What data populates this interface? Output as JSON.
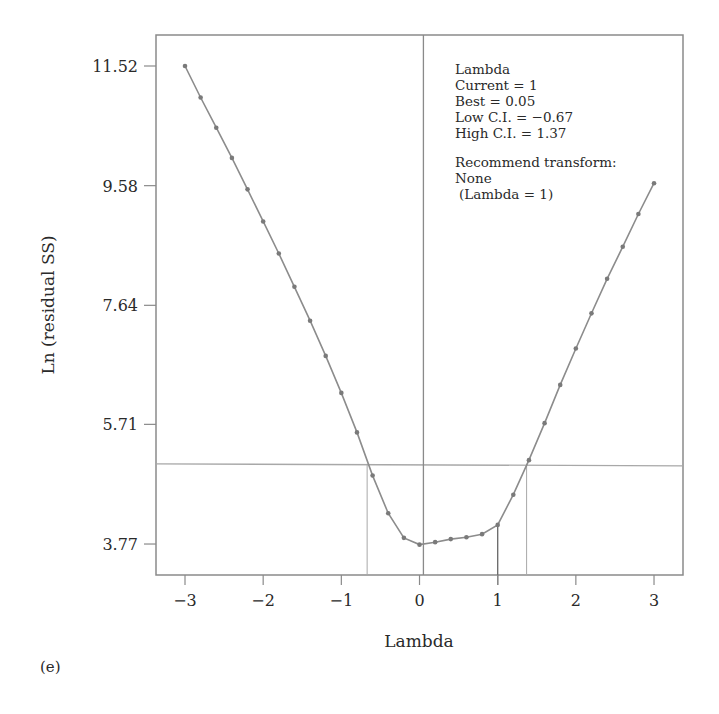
{
  "panel_label": "(e)",
  "chart_data": {
    "type": "line",
    "title": "",
    "xlabel": "Lambda",
    "ylabel": "Ln (residual SS)",
    "xlim": [
      -3.4,
      3.4
    ],
    "ylim": [
      3.3,
      12.0
    ],
    "x_ticks": [
      -3,
      -2,
      -1,
      0,
      1,
      2,
      3
    ],
    "x_tick_labels": [
      "−3",
      "−2",
      "−1",
      "0",
      "1",
      "2",
      "3"
    ],
    "y_ticks": [
      3.77,
      5.71,
      7.64,
      9.58,
      11.52
    ],
    "y_tick_labels": [
      "3.77",
      "5.71",
      "7.64",
      "9.58",
      "11.52"
    ],
    "grid": false,
    "legend": null,
    "series": [
      {
        "name": "Ln (residual SS)",
        "x": [
          -3.0,
          -2.8,
          -2.6,
          -2.4,
          -2.2,
          -2.0,
          -1.8,
          -1.6,
          -1.4,
          -1.2,
          -1.0,
          -0.8,
          -0.6,
          -0.4,
          -0.2,
          0.0,
          0.2,
          0.4,
          0.6,
          0.8,
          1.0,
          1.2,
          1.4,
          1.6,
          1.8,
          2.0,
          2.2,
          2.4,
          2.6,
          2.8,
          3.0
        ],
        "y": [
          11.52,
          11.01,
          10.52,
          10.03,
          9.52,
          9.0,
          8.48,
          7.94,
          7.39,
          6.82,
          6.22,
          5.58,
          4.88,
          4.27,
          3.87,
          3.76,
          3.8,
          3.85,
          3.88,
          3.93,
          4.08,
          4.57,
          5.13,
          5.73,
          6.35,
          6.94,
          7.51,
          8.07,
          8.59,
          9.12,
          9.62
        ]
      }
    ],
    "reference_lines": {
      "ci_threshold_y": 5.07,
      "low_ci_x": -0.67,
      "best_x": 0.05,
      "current_x": 1,
      "high_ci_x": 1.37
    },
    "annotations": [
      "Lambda",
      "Current = 1",
      "Best = 0.05",
      "Low C.I. = −0.67",
      "High C.I. = 1.37",
      "",
      "Recommend transform:",
      "None",
      " (Lambda = 1)"
    ]
  },
  "info_box": {
    "heading": "Lambda",
    "current": "Current = 1",
    "best": "Best = 0.05",
    "low_ci": "Low C.I. = −0.67",
    "high_ci": "High C.I. = 1.37",
    "recommend": "Recommend transform:",
    "transform": "None",
    "transform_lambda": "(Lambda = 1)"
  },
  "colors": {
    "frame": "#8a8a8a",
    "curve": "#8c8c8c",
    "marker": "#7a7a7a",
    "reference": "#a8a8a8",
    "text": "#2a2a2a"
  }
}
